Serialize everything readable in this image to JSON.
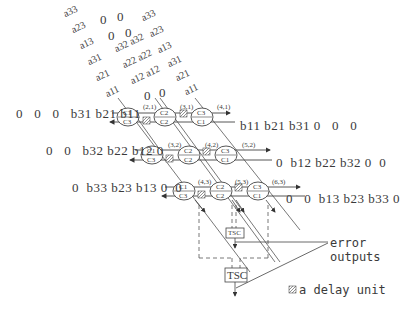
{
  "a_inputs": {
    "column1": [
      "a33",
      "a23",
      "a13",
      "a31",
      "a21",
      "a11"
    ],
    "column2_top": [
      "0",
      "0",
      "0",
      "0"
    ],
    "column2": [
      "a32 a32",
      "a22 a22",
      "a12 a12"
    ],
    "column2_bottom": [
      "0",
      "0"
    ],
    "column3": [
      "a33",
      "a23",
      "a13",
      "a31",
      "a21",
      "a11"
    ]
  },
  "rows": [
    {
      "left_stream": [
        "0",
        "0",
        "0",
        "b31",
        "b21",
        "b11"
      ],
      "right_stream": [
        "b11",
        "b21",
        "b31",
        "0",
        "0",
        "0"
      ],
      "cells": [
        {
          "label": "(2,1)",
          "top": "C1",
          "bottom": "C3"
        },
        {
          "label": "(3,1)",
          "top": "C2",
          "bottom": "C2"
        },
        {
          "label": "(4,1)",
          "top": "C3",
          "bottom": "C1"
        }
      ]
    },
    {
      "left_stream": [
        "0",
        "0",
        "b32",
        "b22",
        "b12",
        "0"
      ],
      "right_stream": [
        "0",
        "b12",
        "b22",
        "b32",
        "0",
        "0"
      ],
      "cells": [
        {
          "label": "(3,2)",
          "top": "C1",
          "bottom": "C3"
        },
        {
          "label": "(4,2)",
          "top": "C2",
          "bottom": "C2"
        },
        {
          "label": "(5,2)",
          "top": "C3",
          "bottom": "C1"
        }
      ]
    },
    {
      "left_stream": [
        "0",
        "b33",
        "b23",
        "b13",
        "0",
        "0"
      ],
      "right_stream": [
        "0",
        "0",
        "b13",
        "b23",
        "b33",
        "0"
      ],
      "cells": [
        {
          "label": "(4,3)",
          "top": "C1",
          "bottom": "C3"
        },
        {
          "label": "(5,3)",
          "top": "C2",
          "bottom": "C2"
        },
        {
          "label": "(6,3)",
          "top": "C3",
          "bottom": "C1"
        }
      ]
    }
  ],
  "checkers": {
    "small": "TSC",
    "large": "TSC"
  },
  "annotations": {
    "error_line1": "error",
    "error_line2": "outputs",
    "legend": "a delay unit"
  },
  "colors": {
    "line": "#444444",
    "hatch": "#777777",
    "background": "#ffffff"
  }
}
